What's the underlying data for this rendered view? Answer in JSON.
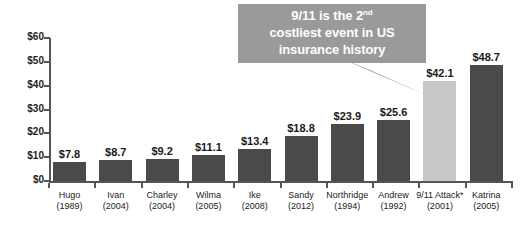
{
  "chart_data": {
    "type": "bar",
    "title": "",
    "xlabel": "",
    "ylabel": "",
    "ylim": [
      0,
      60
    ],
    "grid": false,
    "legend": "none",
    "y_ticks": [
      "$0",
      "$10",
      "$20",
      "$30",
      "$40",
      "$50",
      "$60"
    ],
    "y_tick_values": [
      0,
      10,
      20,
      30,
      40,
      50,
      60
    ],
    "categories": [
      "Hugo",
      "Ivan",
      "Charley",
      "Wilma",
      "Ike",
      "Sandy",
      "Northridge",
      "Andrew",
      "9/11 Attack*",
      "Katrina"
    ],
    "category_years": [
      "(1989)",
      "(2004)",
      "(2004)",
      "(2005)",
      "(2008)",
      "(2012)",
      "(1994)",
      "(1992)",
      "(2001)",
      "(2005)"
    ],
    "values": [
      7.8,
      8.7,
      9.2,
      11.1,
      13.4,
      18.8,
      23.9,
      25.6,
      42.1,
      48.7
    ],
    "value_labels": [
      "$7.8",
      "$8.7",
      "$9.2",
      "$11.1",
      "$13.4",
      "$18.8",
      "$23.9",
      "$25.6",
      "$42.1",
      "$48.7"
    ],
    "bar_colors": [
      "#4a4a4a",
      "#4a4a4a",
      "#4a4a4a",
      "#4a4a4a",
      "#4a4a4a",
      "#4a4a4a",
      "#4a4a4a",
      "#4a4a4a",
      "#c8c8c8",
      "#4a4a4a"
    ],
    "highlight_index": 8,
    "highlight_color": "#c8c8c8",
    "default_bar_color": "#4a4a4a",
    "axis_color": "#555555"
  },
  "callout": {
    "line1_part1": "9/11 is the 2",
    "line1_sup": "nd",
    "line2": "costliest event in US",
    "line3": "insurance history",
    "background_color": "#9a9a9a",
    "text_color": "#ffffff"
  }
}
